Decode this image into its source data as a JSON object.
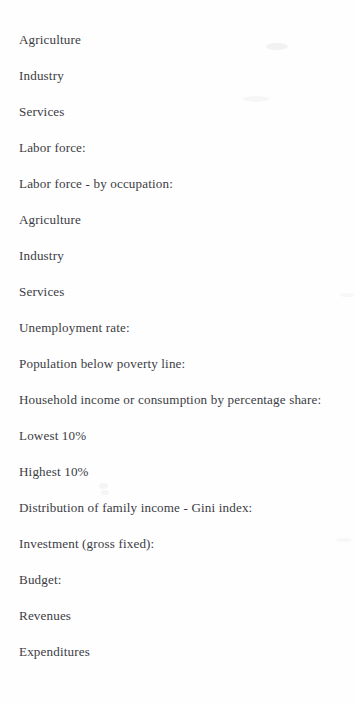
{
  "document": {
    "page_type": "scanned-text-page",
    "background_color": "#fefefe",
    "ink_color": "#3c3c44",
    "lines": [
      {
        "text": "Agriculture"
      },
      {
        "text": "Industry"
      },
      {
        "text": "Services"
      },
      {
        "text": "Labor force:"
      },
      {
        "text": "Labor force - by occupation:"
      },
      {
        "text": "Agriculture"
      },
      {
        "text": "Industry"
      },
      {
        "text": "Services"
      },
      {
        "text": "Unemployment rate:"
      },
      {
        "text": "Population below poverty line:"
      },
      {
        "text": "Household income or consumption by percentage share:"
      },
      {
        "text": "Lowest 10%"
      },
      {
        "text": "Highest 10%"
      },
      {
        "text": "Distribution of family income - Gini index:"
      },
      {
        "text": "Investment (gross fixed):"
      },
      {
        "text": "Budget:"
      },
      {
        "text": "Revenues"
      },
      {
        "text": "Expenditures"
      }
    ]
  }
}
